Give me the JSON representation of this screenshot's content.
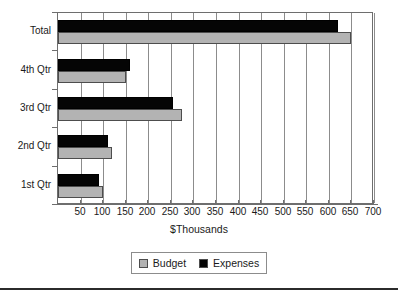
{
  "chart_data": {
    "type": "bar",
    "orientation": "horizontal",
    "title": "",
    "xlabel": "$Thousands",
    "ylabel": "",
    "categories": [
      "1st Qtr",
      "2nd Qtr",
      "3rd Qtr",
      "4th Qtr",
      "Total"
    ],
    "series": [
      {
        "name": "Budget",
        "color": "#b3b3b3",
        "values": [
          100,
          120,
          275,
          150,
          650
        ]
      },
      {
        "name": "Expenses",
        "color": "#050505",
        "values": [
          90,
          110,
          255,
          160,
          620
        ]
      }
    ],
    "xlim": [
      0,
      700
    ],
    "xticks": [
      0,
      50,
      100,
      150,
      200,
      250,
      300,
      350,
      400,
      450,
      500,
      550,
      600,
      650,
      700
    ],
    "xtick_labels": [
      "",
      "50",
      "100",
      "150",
      "200",
      "250",
      "300",
      "350",
      "400",
      "450",
      "500",
      "550",
      "600",
      "650",
      "700"
    ],
    "grid": "vertical",
    "legend_position": "bottom",
    "legend_entries": [
      "Budget",
      "Expenses"
    ]
  },
  "legend": {
    "budget_label": "Budget",
    "expenses_label": "Expenses"
  }
}
